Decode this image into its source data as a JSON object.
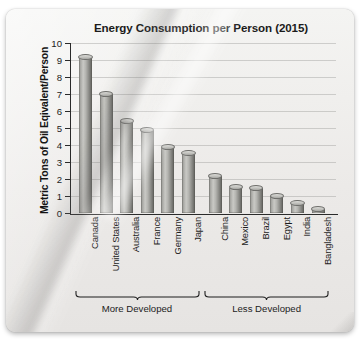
{
  "chart_data": {
    "type": "bar",
    "title": "Energy Consumption per Person (2015)",
    "xlabel": "",
    "ylabel": "Metric Tons of Oil Eqivalent/Person",
    "categories": [
      "Canada",
      "United States",
      "Australia",
      "France",
      "Germany",
      "Japan",
      "China",
      "Mexico",
      "Brazil",
      "Egypt",
      "India",
      "Bangladesh"
    ],
    "values": [
      9.2,
      7.0,
      5.4,
      4.9,
      3.9,
      3.5,
      2.2,
      1.5,
      1.45,
      1.0,
      0.6,
      0.25
    ],
    "ylim": [
      0,
      10
    ],
    "yticks": [
      0,
      1,
      2,
      3,
      4,
      5,
      6,
      7,
      8,
      9,
      10
    ],
    "ytick_labels": [
      "0",
      "1",
      "2",
      "3",
      "4",
      "5",
      "6",
      "7",
      "8",
      "9",
      "10"
    ],
    "grid": true,
    "legend": "none",
    "bar_color": "#b4b4b0",
    "groups": [
      {
        "label": "More Developed",
        "categories": [
          "Canada",
          "United States",
          "Australia",
          "France",
          "Germany",
          "Japan"
        ]
      },
      {
        "label": "Less Developed",
        "categories": [
          "China",
          "Mexico",
          "Brazil",
          "Egypt",
          "India",
          "Bangladesh"
        ]
      }
    ]
  }
}
